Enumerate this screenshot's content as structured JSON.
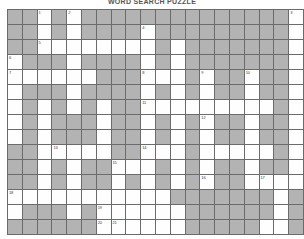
{
  "puzzle": {
    "title": "WORD SEARCH PUZZLE",
    "rows": 15,
    "cols": 20,
    "cell_size_px": 14,
    "colors": {
      "blocked": "#b3b3b3",
      "open": "#fefefe",
      "grid_line": "#6b6b6b",
      "number_text": "#3a3a3a",
      "background": "#ffffff"
    },
    "legend": {
      "blocked_label": "blocked-cell",
      "open_label": "open-cell"
    },
    "grid": [
      [
        "B",
        "B",
        "O",
        "B",
        "O",
        "B",
        "B",
        "B",
        "B",
        "B",
        "B",
        "B",
        "B",
        "B",
        "B",
        "B",
        "B",
        "B",
        "B",
        "O"
      ],
      [
        "B",
        "B",
        "O",
        "B",
        "O",
        "B",
        "B",
        "B",
        "B",
        "O",
        "B",
        "B",
        "B",
        "B",
        "B",
        "B",
        "B",
        "B",
        "B",
        "O"
      ],
      [
        "B",
        "B",
        "O",
        "O",
        "O",
        "O",
        "O",
        "O",
        "O",
        "O",
        "B",
        "O",
        "B",
        "B",
        "B",
        "B",
        "B",
        "B",
        "B",
        "O"
      ],
      [
        "O",
        "B",
        "B",
        "B",
        "O",
        "B",
        "B",
        "B",
        "B",
        "O",
        "B",
        "O",
        "B",
        "B",
        "B",
        "B",
        "B",
        "B",
        "B",
        "O"
      ],
      [
        "O",
        "O",
        "O",
        "O",
        "O",
        "O",
        "B",
        "B",
        "B",
        "O",
        "O",
        "O",
        "B",
        "O",
        "B",
        "B",
        "O",
        "B",
        "B",
        "O"
      ],
      [
        "O",
        "B",
        "B",
        "B",
        "O",
        "B",
        "B",
        "B",
        "B",
        "O",
        "B",
        "O",
        "B",
        "O",
        "B",
        "B",
        "O",
        "B",
        "B",
        "O"
      ],
      [
        "O",
        "B",
        "O",
        "B",
        "O",
        "B",
        "O",
        "B",
        "B",
        "O",
        "O",
        "O",
        "O",
        "O",
        "O",
        "O",
        "O",
        "O",
        "B",
        "O"
      ],
      [
        "O",
        "B",
        "O",
        "B",
        "B",
        "B",
        "O",
        "B",
        "B",
        "O",
        "B",
        "O",
        "B",
        "O",
        "B",
        "B",
        "O",
        "B",
        "B",
        "O"
      ],
      [
        "O",
        "B",
        "O",
        "B",
        "B",
        "B",
        "O",
        "B",
        "B",
        "O",
        "B",
        "O",
        "B",
        "O",
        "B",
        "B",
        "O",
        "B",
        "B",
        "O"
      ],
      [
        "B",
        "B",
        "O",
        "O",
        "O",
        "O",
        "O",
        "B",
        "B",
        "O",
        "O",
        "O",
        "B",
        "O",
        "O",
        "O",
        "O",
        "O",
        "B",
        "O"
      ],
      [
        "B",
        "B",
        "O",
        "B",
        "O",
        "B",
        "B",
        "O",
        "O",
        "O",
        "B",
        "O",
        "B",
        "O",
        "B",
        "B",
        "O",
        "B",
        "B",
        "O"
      ],
      [
        "B",
        "B",
        "O",
        "B",
        "O",
        "B",
        "B",
        "O",
        "B",
        "O",
        "B",
        "O",
        "B",
        "O",
        "B",
        "B",
        "O",
        "O",
        "O",
        "O"
      ],
      [
        "O",
        "O",
        "O",
        "O",
        "O",
        "O",
        "O",
        "O",
        "O",
        "O",
        "O",
        "B",
        "B",
        "B",
        "B",
        "B",
        "B",
        "B",
        "O",
        "B"
      ],
      [
        "O",
        "B",
        "B",
        "B",
        "O",
        "B",
        "O",
        "O",
        "O",
        "O",
        "O",
        "O",
        "B",
        "B",
        "B",
        "B",
        "B",
        "B",
        "O",
        "B"
      ],
      [
        "B",
        "B",
        "B",
        "B",
        "B",
        "B",
        "O",
        "O",
        "O",
        "O",
        "O",
        "O",
        "B",
        "B",
        "B",
        "B",
        "B",
        "O",
        "O",
        "B"
      ]
    ],
    "numbers": [
      {
        "row": 0,
        "col": 2,
        "label": "1"
      },
      {
        "row": 0,
        "col": 4,
        "label": "2"
      },
      {
        "row": 0,
        "col": 19,
        "label": "3"
      },
      {
        "row": 1,
        "col": 9,
        "label": "4"
      },
      {
        "row": 2,
        "col": 2,
        "label": "5"
      },
      {
        "row": 3,
        "col": 0,
        "label": "6"
      },
      {
        "row": 4,
        "col": 0,
        "label": "7"
      },
      {
        "row": 4,
        "col": 9,
        "label": "8"
      },
      {
        "row": 4,
        "col": 13,
        "label": "9"
      },
      {
        "row": 4,
        "col": 16,
        "label": "10"
      },
      {
        "row": 6,
        "col": 9,
        "label": "11"
      },
      {
        "row": 7,
        "col": 13,
        "label": "12"
      },
      {
        "row": 9,
        "col": 3,
        "label": "13"
      },
      {
        "row": 9,
        "col": 9,
        "label": "14"
      },
      {
        "row": 10,
        "col": 7,
        "label": "15"
      },
      {
        "row": 11,
        "col": 13,
        "label": "16"
      },
      {
        "row": 11,
        "col": 17,
        "label": "17"
      },
      {
        "row": 12,
        "col": 0,
        "label": "18"
      },
      {
        "row": 13,
        "col": 6,
        "label": "19"
      },
      {
        "row": 14,
        "col": 6,
        "label": "20"
      },
      {
        "row": 14,
        "col": 7,
        "label": "21"
      }
    ]
  }
}
